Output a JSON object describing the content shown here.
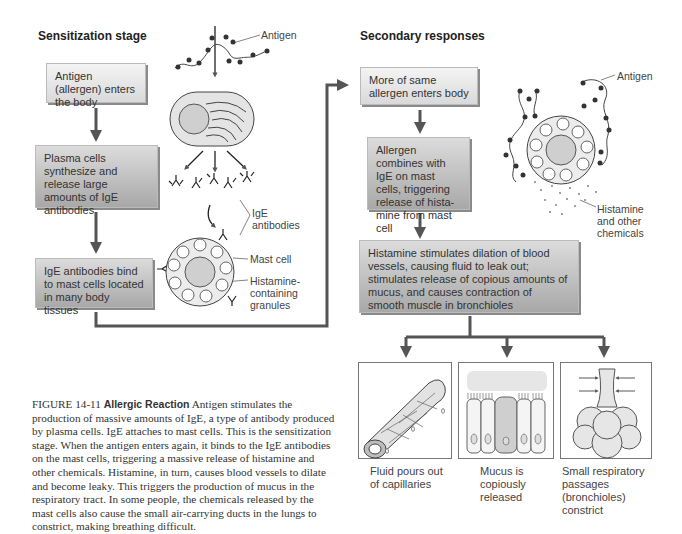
{
  "sensitization": {
    "heading": "Sensitization stage",
    "steps": [
      "Antigen (allergen) enters the body",
      "Plasma cells synthesize and release large amounts of IgE antibodies",
      "IgE antibodies bind to mast cells located in many body tissues"
    ],
    "labels": {
      "antigen": "Antigen",
      "ige_antibodies_1": "IgE",
      "ige_antibodies_2": "antibodies",
      "mast_cell": "Mast cell",
      "granules_1": "Histamine-",
      "granules_2": "containing",
      "granules_3": "granules"
    }
  },
  "secondary": {
    "heading": "Secondary responses",
    "steps": [
      "More of same allergen enters body",
      "Allergen combines with IgE on mast cells, triggering release of hista-mine from mast cell",
      "Histamine stimulates dilation of blood vessels, causing fluid to leak out; stimulates release of copious amounts of mucus, and causes contraction of smooth muscle in bronchioles"
    ],
    "labels": {
      "antigen": "Antigen",
      "histamine_1": "Histamine",
      "histamine_2": "and other",
      "histamine_3": "chemicals"
    },
    "outcomes": [
      {
        "line1": "Fluid pours out",
        "line2": "of capillaries",
        "line3": "",
        "line4": ""
      },
      {
        "line1": "Mucus is",
        "line2": "copiously",
        "line3": "released",
        "line4": ""
      },
      {
        "line1": "Small respiratory",
        "line2": "passages",
        "line3": "(bronchioles)",
        "line4": "constrict"
      }
    ]
  },
  "caption": {
    "figure_label": "FIGURE 14-11",
    "title": "Allergic Reaction",
    "body": "Antigen stimulates the production of massive amounts of IgE, a type of antibody produced by plasma cells. IgE attaches to mast cells. This is the sensitization stage. When the antigen enters again, it binds to the IgE antibodies on the mast cells, triggering a massive release of histamine and other chemicals. Histamine, in turn, causes blood vessels to dilate and become leaky. This triggers the production of mucus in the respiratory tract. In some people, the chemicals released by the mast cells also cause the small air-carrying ducts in the lungs to constrict, making breathing difficult."
  }
}
